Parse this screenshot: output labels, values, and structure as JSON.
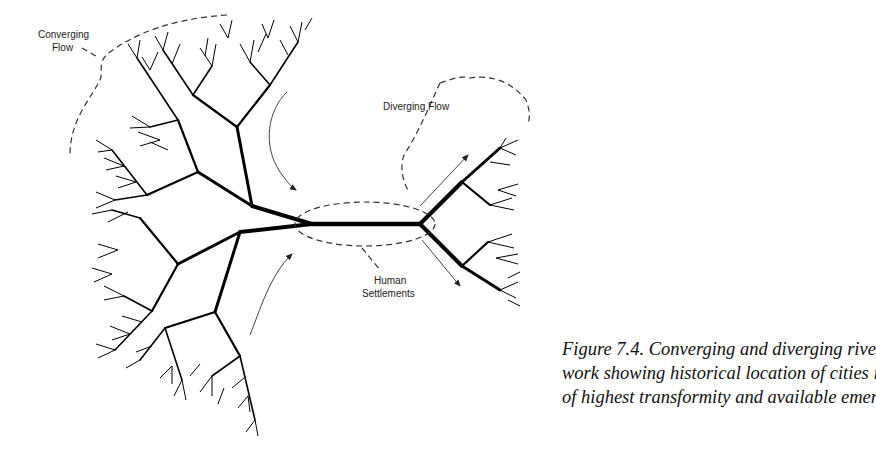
{
  "figure": {
    "labels": {
      "converging_flow_line1": "Converging",
      "converging_flow_line2": "Flow",
      "diverging_flow": "Diverging Flow",
      "human_settlements_line1": "Human",
      "human_settlements_line2": "Settlements"
    },
    "caption": {
      "line1": "Figure 7.4. Converging and diverging river net-",
      "line2": "work showing historical location of cities in zones",
      "line3": "of highest transformity and available emergy."
    },
    "colors": {
      "ink": "#000000",
      "background": "#ffffff"
    }
  }
}
